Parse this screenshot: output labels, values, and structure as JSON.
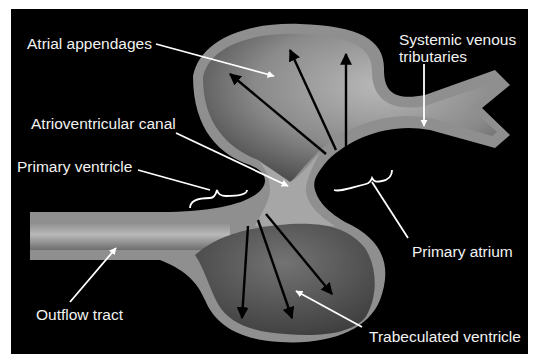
{
  "diagram": {
    "background": "#000000",
    "page_background": "#ffffff",
    "colors": {
      "wall": "#8f8f8f",
      "lumen_light": "#b5b5b5",
      "lumen_dark": "#5a5a5a",
      "ventricle_lumen": "#6a6a6a",
      "label_text": "#f2f2f2",
      "pointer": "#ffffff",
      "flow_arrow": "#000000"
    },
    "labels": [
      {
        "id": "atrial-appendages",
        "text": "Atrial appendages"
      },
      {
        "id": "systemic-venous-1",
        "text": "Systemic venous"
      },
      {
        "id": "systemic-venous-2",
        "text": "tributaries"
      },
      {
        "id": "atrioventricular-canal",
        "text": "Atrioventricular canal"
      },
      {
        "id": "primary-ventricle",
        "text": "Primary ventricle"
      },
      {
        "id": "primary-atrium",
        "text": "Primary atrium"
      },
      {
        "id": "outflow-tract",
        "text": "Outflow tract"
      },
      {
        "id": "trabeculated-ventricle",
        "text": "Trabeculated ventricle"
      }
    ],
    "flow_arrows": {
      "atrial_count": 4,
      "ventricular_count": 3
    }
  }
}
